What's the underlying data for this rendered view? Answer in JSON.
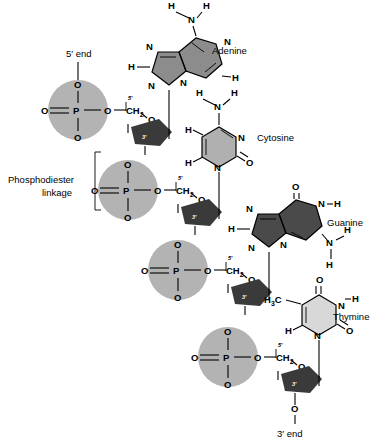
{
  "figure": {
    "end_labels": {
      "five_prime": "5′ end",
      "three_prime": "3′ end"
    },
    "linkage_label_line1": "Phosphodiester",
    "linkage_label_line2": "linkage"
  },
  "colors": {
    "phosphate_circle": "#b3b3b3",
    "sugar_pentagon": "#3a3a3a",
    "adenine_fill": "#8c8c8c",
    "cytosine_fill": "#b0b0b0",
    "guanine_fill": "#4a4a4a",
    "thymine_fill": "#d8d8d8",
    "bond": "#000000",
    "background": "#ffffff"
  },
  "atoms": {
    "O": "O",
    "P": "P",
    "N": "N",
    "H": "H",
    "C": "C",
    "CH2": "CH",
    "sub2": "2",
    "H3C": "H",
    "sub3": "3",
    "C_after": "C",
    "five": "5′",
    "three": "3′"
  },
  "bases": [
    {
      "id": "adenine",
      "label": "Adenine",
      "type": "purine",
      "fill": "#8c8c8c"
    },
    {
      "id": "cytosine",
      "label": "Cytosine",
      "type": "pyrimidine",
      "fill": "#b0b0b0"
    },
    {
      "id": "guanine",
      "label": "Guanine",
      "type": "purine",
      "fill": "#4a4a4a"
    },
    {
      "id": "thymine",
      "label": "Thymine",
      "type": "pyrimidine",
      "fill": "#d8d8d8"
    }
  ],
  "nucleotides": [
    {
      "index": 1,
      "base": "Adenine",
      "phosphate": "P",
      "sugar_5": "5′",
      "sugar_3": "3′"
    },
    {
      "index": 2,
      "base": "Cytosine",
      "phosphate": "P",
      "sugar_5": "5′",
      "sugar_3": "3′"
    },
    {
      "index": 3,
      "base": "Guanine",
      "phosphate": "P",
      "sugar_5": "5′",
      "sugar_3": "3′"
    },
    {
      "index": 4,
      "base": "Thymine",
      "phosphate": "P",
      "sugar_5": "5′",
      "sugar_3": "3′"
    }
  ]
}
